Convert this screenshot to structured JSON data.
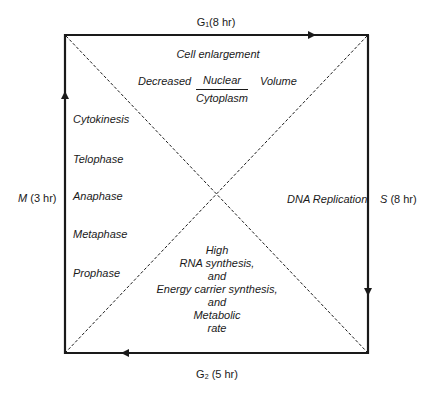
{
  "diagram": {
    "type": "cell-cycle-square",
    "phases": {
      "g1": {
        "label": "G",
        "sub": "1",
        "duration": "(8 hr)"
      },
      "s": {
        "label": "S",
        "duration": "(8 hr)"
      },
      "g2": {
        "label": "G",
        "sub": "2",
        "duration": "(5 hr)"
      },
      "m": {
        "label": "M",
        "duration": "(3 hr)"
      }
    },
    "top_region": {
      "line1": "Cell enlargement",
      "decreased": "Decreased",
      "fraction_numerator": "Nuclear",
      "fraction_denominator": "Cytoplasm",
      "volume": "Volume"
    },
    "left_region": {
      "items": [
        "Cytokinesis",
        "Telophase",
        "Anaphase",
        "Metaphase",
        "Prophase"
      ]
    },
    "right_region": {
      "label": "DNA Replication"
    },
    "bottom_region": {
      "lines": [
        "High",
        "RNA synthesis,",
        "and",
        "Energy carrier synthesis,",
        "and",
        "Metabolic",
        "rate"
      ]
    },
    "colors": {
      "line": "#1a1a1a",
      "background": "#ffffff"
    }
  }
}
